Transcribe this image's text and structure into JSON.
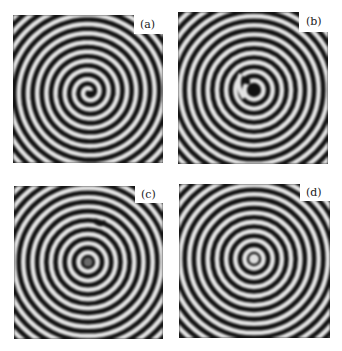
{
  "figure": {
    "panels": [
      {
        "id": "a",
        "label": "(a)",
        "pattern": "spiral",
        "core": "spiral-tip"
      },
      {
        "id": "b",
        "label": "(b)",
        "pattern": "target-with-defect",
        "core": "dark"
      },
      {
        "id": "c",
        "label": "(c)",
        "pattern": "target-with-defect",
        "core": "gray"
      },
      {
        "id": "d",
        "label": "(d)",
        "pattern": "target",
        "core": "light"
      }
    ],
    "colors": {
      "dark_stripe": "#111111",
      "light_stripe": "#e6e6e6",
      "background": "#ffffff"
    }
  }
}
